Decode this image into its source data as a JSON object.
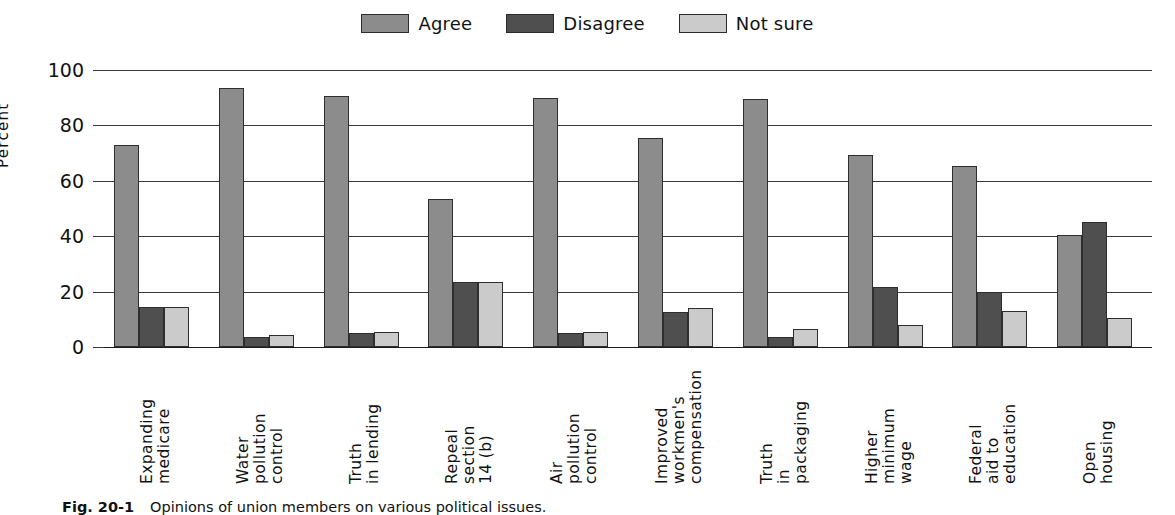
{
  "figure": {
    "caption_number": "Fig. 20-1",
    "caption_text": "Opinions of union members on various political issues."
  },
  "legend": {
    "position": "top-center",
    "entries": [
      {
        "label": "Agree",
        "color": "#8c8c8c",
        "icon": "legend-swatch-icon"
      },
      {
        "label": "Disagree",
        "color": "#4f4f4f",
        "icon": "legend-swatch-icon"
      },
      {
        "label": "Not sure",
        "color": "#cbcbcb",
        "icon": "legend-swatch-icon"
      }
    ]
  },
  "axes": {
    "y_title": "Percent",
    "y_ticks": [
      "0",
      "20",
      "40",
      "60",
      "80",
      "100"
    ],
    "y_min": 0,
    "y_max": 100
  },
  "chart_data": {
    "type": "bar",
    "title": "",
    "subtitle": "",
    "xlabel": "",
    "ylabel": "Percent",
    "ylim": [
      0,
      100
    ],
    "grid": true,
    "legend_position": "top-center",
    "categories": [
      "Expanding medicare",
      "Water pollution control",
      "Truth in lending",
      "Repeal section 14 (b)",
      "Air pollution control",
      "Improved workmen's compensation",
      "Truth in packaging",
      "Higher minimum wage",
      "Federal aid to education",
      "Open housing"
    ],
    "category_lines": [
      [
        "Expanding",
        "medicare"
      ],
      [
        "Water",
        "pollution",
        "control"
      ],
      [
        "Truth",
        "in lending"
      ],
      [
        "Repeal",
        "section",
        "14 (b)"
      ],
      [
        "Air",
        "pollution",
        "control"
      ],
      [
        "Improved",
        "workmen's",
        "compensation"
      ],
      [
        "Truth",
        "in",
        "packaging"
      ],
      [
        "Higher",
        "minimum",
        "wage"
      ],
      [
        "Federal",
        "aid to",
        "education"
      ],
      [
        "Open",
        "housing"
      ]
    ],
    "series": [
      {
        "name": "Agree",
        "color": "#8c8c8c",
        "values": [
          73,
          93.5,
          90.5,
          53.5,
          90,
          75.5,
          89.5,
          69.5,
          65.5,
          40.5
        ]
      },
      {
        "name": "Disagree",
        "color": "#4f4f4f",
        "values": [
          14.5,
          3.5,
          5,
          23.5,
          5,
          12.5,
          3.5,
          21.5,
          20,
          45
        ]
      },
      {
        "name": "Not sure",
        "color": "#cbcbcb",
        "values": [
          14.5,
          4.5,
          5.5,
          23.5,
          5.5,
          14,
          6.5,
          8,
          13,
          10.5
        ]
      }
    ]
  }
}
